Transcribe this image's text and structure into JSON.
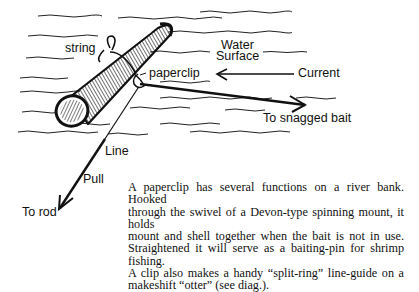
{
  "diagram": {
    "labels": {
      "string": "string",
      "paperclip": "paperclip",
      "water_surface_line1": "Water",
      "water_surface_line2": "Surface",
      "current": "Current",
      "snagged_bait": "To snagged bait",
      "line": "Line",
      "pull": "Pull",
      "to_rod": "To rod"
    },
    "colors": {
      "ink": "#111111",
      "background": "#ffffff"
    }
  },
  "caption": {
    "lines": [
      "A paperclip has several functions on a river bank. Hooked",
      "through the swivel of a Devon-type spinning mount, it holds",
      "mount and shell together when the bait is not in use.",
      "Straightened it will serve as a baiting-pin for shrimp fishing.",
      "A clip also makes a handy “split-ring” line-guide on a",
      "makeshift “otter” (see diag.)."
    ]
  }
}
